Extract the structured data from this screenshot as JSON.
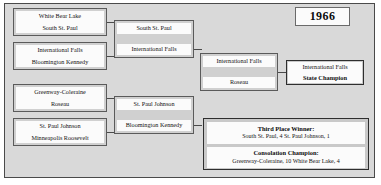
{
  "tournament": {
    "year": "1966",
    "champion_label": "State Champion",
    "champion_team": "International Falls"
  },
  "rounds": {
    "quarterfinals": [
      {
        "top": "White Bear Lake",
        "bottom": "South St. Paul"
      },
      {
        "top": "International Falls",
        "bottom": "Bloomington Kennedy"
      },
      {
        "top": "Greenway-Coleraine",
        "bottom": "Roseau"
      },
      {
        "top": "St. Paul Johnson",
        "bottom": "Minneapolis Roosevelt"
      }
    ],
    "semifinals": [
      {
        "top": "South St. Paul",
        "bottom": "International Falls"
      },
      {
        "top": "St. Paul Johnson",
        "bottom": "Bloomington Kennedy"
      }
    ],
    "final": [
      {
        "top": "International Falls",
        "bottom": "Roseau"
      }
    ]
  },
  "results": {
    "third_place": {
      "heading": "Third Place Winner:",
      "line": "South St. Paul, 4  St. Paul Johnson, 1"
    },
    "consolation": {
      "heading": "Consolation Champion:",
      "line": "Greenway-Coleraine, 10  White Bear Lake, 4"
    }
  }
}
